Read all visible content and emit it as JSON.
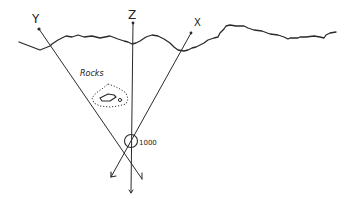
{
  "diagram": {
    "type": "cross-section sketch",
    "labels": {
      "y_axis": "Y",
      "z_axis": "Z",
      "x_axis": "X",
      "rocks": "Rocks",
      "depth": "1000"
    },
    "colors": {
      "ink": "#2a2a2a",
      "background": "#ffffff"
    },
    "elements": [
      {
        "name": "ground-surface",
        "kind": "irregular line"
      },
      {
        "name": "y-line",
        "from_label": "Y",
        "direction": "down-right"
      },
      {
        "name": "z-line",
        "from_label": "Z",
        "direction": "vertical"
      },
      {
        "name": "x-line",
        "from_label": "X",
        "direction": "down-left"
      },
      {
        "name": "rocks-outline",
        "kind": "dotted region with inner diamond"
      },
      {
        "name": "intersection-circle",
        "annotation": "1000"
      }
    ]
  }
}
